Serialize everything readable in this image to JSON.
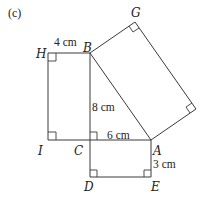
{
  "figure": {
    "tag": "(c)",
    "points": {
      "H": "H",
      "B": "B",
      "G": "G",
      "I": "I",
      "C": "C",
      "A": "A",
      "D": "D",
      "E": "E"
    },
    "dimensions": {
      "HB": "4 cm",
      "BC": "8 cm",
      "CA": "6 cm",
      "AE": "3 cm"
    },
    "shapes": [
      {
        "name": "rectangle HBCI",
        "sides": [
          "HB = 4 cm",
          "BC = 8 cm"
        ]
      },
      {
        "name": "rectangle CAED",
        "sides": [
          "CA = 6 cm",
          "AE = 3 cm"
        ]
      },
      {
        "name": "rectangle on hypotenuse BA with corner G"
      },
      {
        "name": "right triangle BCA",
        "right_angle_at": "C"
      }
    ]
  }
}
